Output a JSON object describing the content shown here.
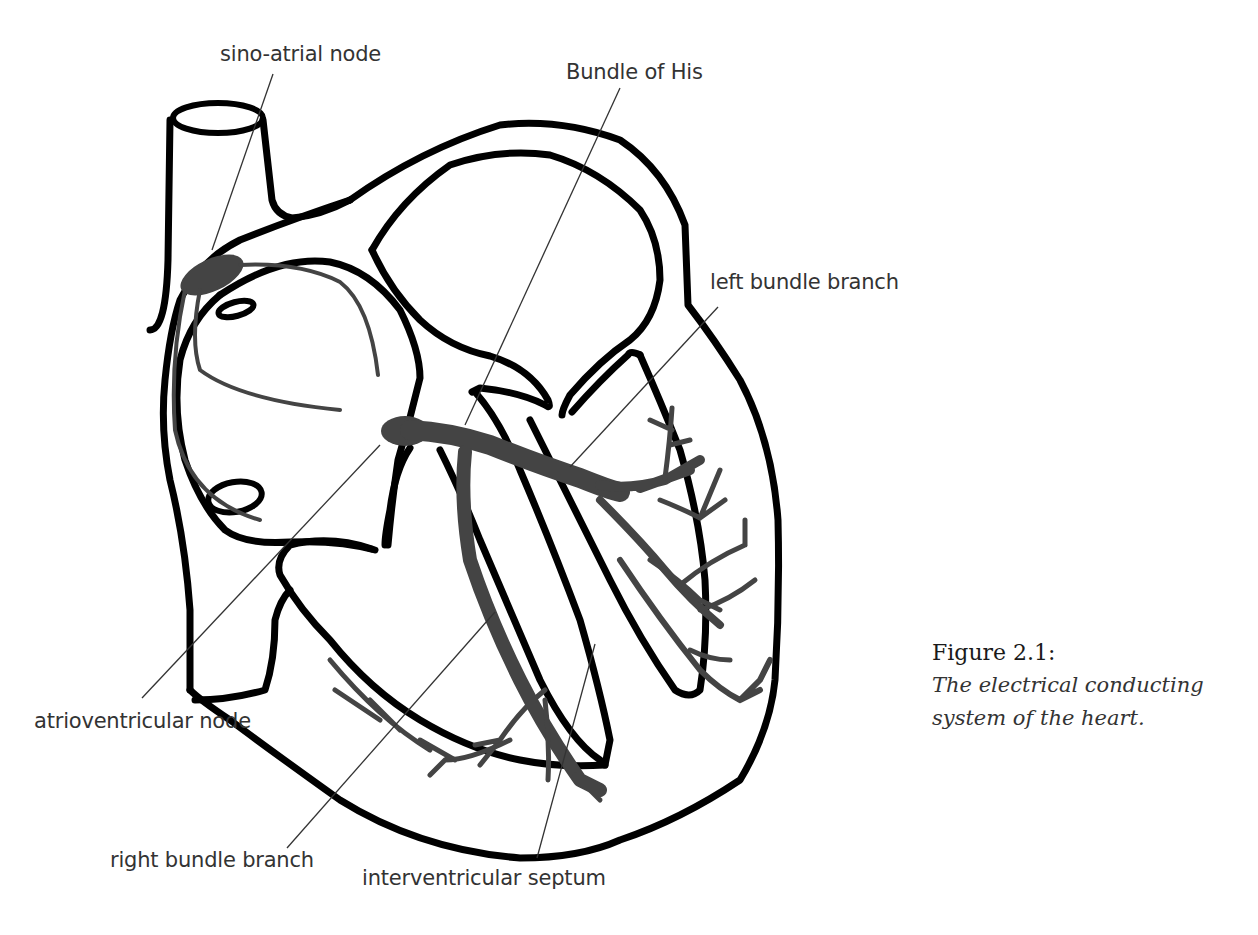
{
  "figure": {
    "title": "Figure 2.1:",
    "caption_line1": "The electrical conducting",
    "caption_line2": "system of the heart.",
    "colors": {
      "outline": "#000000",
      "conducting_tissue": "#444444",
      "label_text": "#333333",
      "leader_line": "#333333",
      "background": "#ffffff"
    }
  },
  "labels": {
    "sino_atrial_node": "sino-atrial node",
    "bundle_of_his": "Bundle of His",
    "left_bundle_branch": "left bundle branch",
    "atrioventricular_node": "atrioventricular node",
    "right_bundle_branch": "right bundle branch",
    "interventricular_septum": "interventricular septum"
  }
}
